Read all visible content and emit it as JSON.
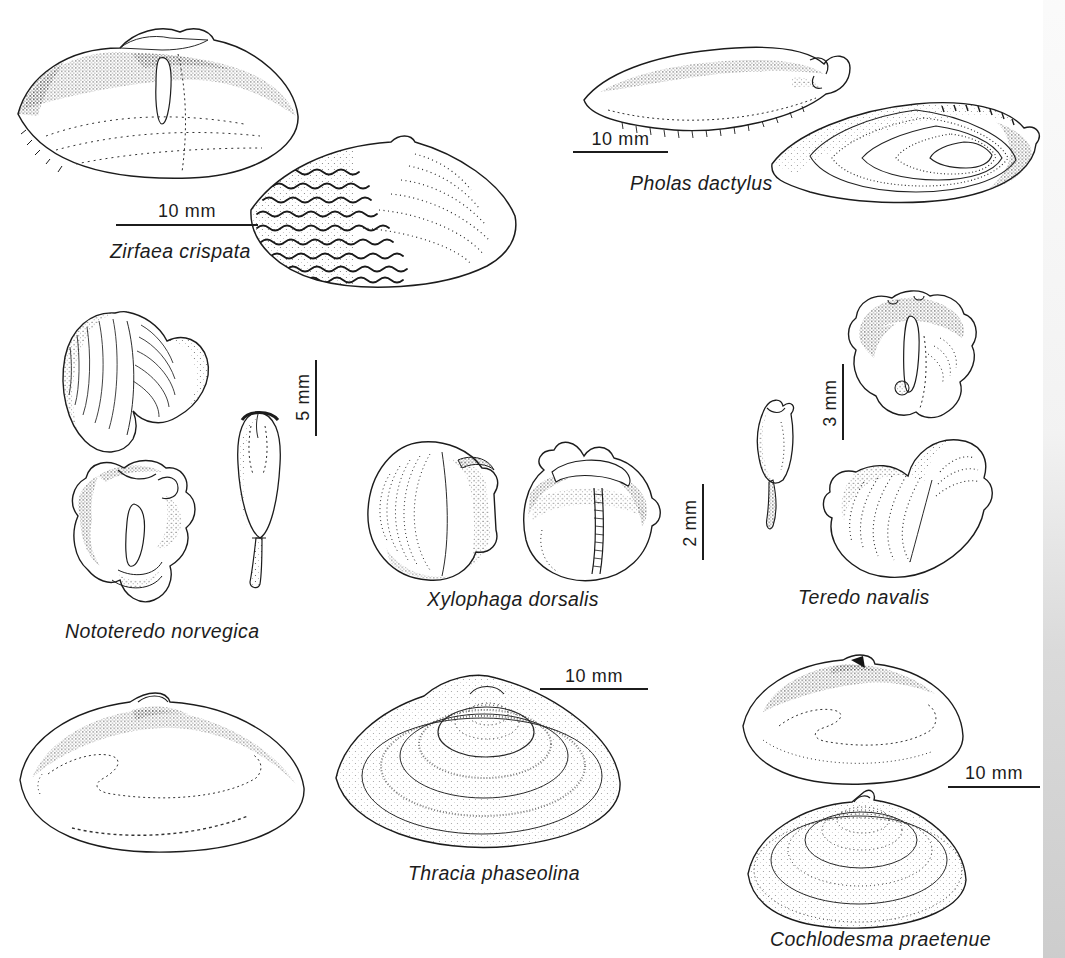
{
  "figure": {
    "colors": {
      "ink": "#1c1c1c",
      "paper": "#ffffff",
      "scan_edge": "#c9c9c9"
    },
    "species": [
      {
        "name": "Zirfaea crispata",
        "scale_label": "10 mm",
        "scale_orientation": "horizontal",
        "drawings": 2
      },
      {
        "name": "Pholas dactylus",
        "scale_label": "10 mm",
        "scale_orientation": "horizontal",
        "drawings": 2
      },
      {
        "name": "Nototeredo norvegica",
        "scale_label": "5 mm",
        "scale_orientation": "vertical",
        "drawings": 3
      },
      {
        "name": "Xylophaga dorsalis",
        "scale_label": "2 mm",
        "scale_orientation": "vertical",
        "drawings": 2
      },
      {
        "name": "Teredo navalis",
        "scale_label": "3 mm",
        "scale_orientation": "vertical",
        "drawings": 3
      },
      {
        "name": "Thracia phaseolina",
        "scale_label": "10 mm",
        "scale_orientation": "horizontal",
        "drawings": 2
      },
      {
        "name": "Cochlodesma praetenue",
        "scale_label": "10 mm",
        "scale_orientation": "horizontal",
        "drawings": 2
      }
    ]
  }
}
